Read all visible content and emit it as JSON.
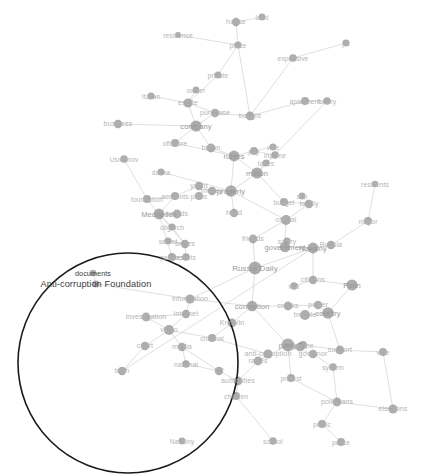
{
  "figure": {
    "type": "network-graph",
    "title": "",
    "width": 428,
    "height": 475,
    "background_color": "#ffffff",
    "node_color": "#8d8d8d",
    "edge_color": "#c9c9c9",
    "label_color": "#b4b4b4",
    "highlight_color": "#1a1a1a"
  },
  "highlight": {
    "shape": "circle",
    "label": "highlighted-cluster",
    "cx": 128,
    "cy": 363,
    "r": 110
  },
  "chart_data": {
    "type": "scatter",
    "title": "",
    "xlabel": "",
    "ylabel": "",
    "grid": false,
    "legend": "none",
    "nodes": [
      {
        "label": "residence",
        "x": 178,
        "y": 35,
        "size": 3.0,
        "weight": 1
      },
      {
        "label": "house",
        "x": 236,
        "y": 22,
        "size": 4.2,
        "weight": 2
      },
      {
        "label": "land",
        "x": 262,
        "y": 17,
        "size": 3.4,
        "weight": 1
      },
      {
        "label": "place",
        "x": 238,
        "y": 45,
        "size": 3.6,
        "weight": 1
      },
      {
        "label": "private",
        "x": 218,
        "y": 75,
        "size": 3.6,
        "weight": 1
      },
      {
        "label": "owner",
        "x": 196,
        "y": 90,
        "size": 3.4,
        "weight": 1
      },
      {
        "label": "estate",
        "x": 188,
        "y": 103,
        "size": 4.6,
        "weight": 2
      },
      {
        "label": "Italian",
        "x": 151,
        "y": 96,
        "size": 3.6,
        "weight": 1
      },
      {
        "label": "purchase",
        "x": 215,
        "y": 113,
        "size": 4.2,
        "weight": 2
      },
      {
        "label": "bought",
        "x": 250,
        "y": 116,
        "size": 4.4,
        "weight": 2
      },
      {
        "label": "expensive",
        "x": 293,
        "y": 58,
        "size": 3.8,
        "weight": 1
      },
      {
        "label": "jet",
        "x": 346,
        "y": 43,
        "size": 3.4,
        "weight": 1
      },
      {
        "label": "apartment",
        "x": 305,
        "y": 101,
        "size": 4.0,
        "weight": 1
      },
      {
        "label": "luxury",
        "x": 327,
        "y": 101,
        "size": 3.8,
        "weight": 1
      },
      {
        "label": "business",
        "x": 118,
        "y": 124,
        "size": 4.2,
        "weight": 2
      },
      {
        "label": "company",
        "x": 196,
        "y": 126,
        "size": 5.6,
        "weight": 3
      },
      {
        "label": "offshore",
        "x": 175,
        "y": 143,
        "size": 4.0,
        "weight": 1
      },
      {
        "label": "billion",
        "x": 211,
        "y": 148,
        "size": 4.4,
        "weight": 2
      },
      {
        "label": "rubles",
        "x": 234,
        "y": 156,
        "size": 5.4,
        "weight": 3
      },
      {
        "label": "pay",
        "x": 254,
        "y": 151,
        "size": 4.0,
        "weight": 1
      },
      {
        "label": "wife",
        "x": 273,
        "y": 147,
        "size": 3.4,
        "weight": 1
      },
      {
        "label": "income",
        "x": 275,
        "y": 155,
        "size": 3.8,
        "weight": 1
      },
      {
        "label": "taxes",
        "x": 266,
        "y": 163,
        "size": 3.6,
        "weight": 1
      },
      {
        "label": "Usmanov",
        "x": 124,
        "y": 159,
        "size": 3.8,
        "weight": 1
      },
      {
        "label": "dacha",
        "x": 161,
        "y": 172,
        "size": 3.6,
        "weight": 1
      },
      {
        "label": "million",
        "x": 257,
        "y": 173,
        "size": 5.6,
        "weight": 3
      },
      {
        "label": "money",
        "x": 212,
        "y": 191,
        "size": 4.2,
        "weight": 2
      },
      {
        "label": "property",
        "x": 231,
        "y": 191,
        "size": 5.8,
        "weight": 3
      },
      {
        "label": "yacht",
        "x": 199,
        "y": 186,
        "size": 4.2,
        "weight": 2
      },
      {
        "label": "plans",
        "x": 199,
        "y": 196,
        "size": 4.0,
        "weight": 1
      },
      {
        "label": "foundation",
        "x": 147,
        "y": 199,
        "size": 4.0,
        "weight": 1
      },
      {
        "label": "accounts",
        "x": 175,
        "y": 196,
        "size": 4.0,
        "weight": 1
      },
      {
        "label": "head",
        "x": 234,
        "y": 213,
        "size": 4.2,
        "weight": 2
      },
      {
        "label": "budget",
        "x": 284,
        "y": 202,
        "size": 4.0,
        "weight": 1
      },
      {
        "label": "son",
        "x": 302,
        "y": 196,
        "size": 3.4,
        "weight": 1
      },
      {
        "label": "family",
        "x": 309,
        "y": 204,
        "size": 4.2,
        "weight": 2
      },
      {
        "label": "residents",
        "x": 375,
        "y": 184,
        "size": 3.2,
        "weight": 1
      },
      {
        "label": "Medvedev",
        "x": 159,
        "y": 214,
        "size": 5.4,
        "weight": 3
      },
      {
        "label": "boards",
        "x": 177,
        "y": 214,
        "size": 4.4,
        "weight": 2
      },
      {
        "label": "oligarch",
        "x": 172,
        "y": 227,
        "size": 3.6,
        "weight": 1
      },
      {
        "label": "official",
        "x": 286,
        "y": 220,
        "size": 5.0,
        "weight": 2
      },
      {
        "label": "mayor",
        "x": 368,
        "y": 221,
        "size": 4.0,
        "weight": 1
      },
      {
        "label": "secret",
        "x": 168,
        "y": 241,
        "size": 3.6,
        "weight": 1
      },
      {
        "label": "bribes",
        "x": 185,
        "y": 244,
        "size": 4.2,
        "weight": 2
      },
      {
        "label": "friends",
        "x": 253,
        "y": 239,
        "size": 4.4,
        "weight": 2
      },
      {
        "label": "salary",
        "x": 287,
        "y": 241,
        "size": 3.6,
        "weight": 1
      },
      {
        "label": "government",
        "x": 285,
        "y": 247,
        "size": 5.2,
        "weight": 3
      },
      {
        "label": "Navalny",
        "x": 313,
        "y": 248,
        "size": 5.4,
        "weight": 3
      },
      {
        "label": "Russia",
        "x": 331,
        "y": 245,
        "size": 4.2,
        "weight": 2
      },
      {
        "label": "palaces",
        "x": 172,
        "y": 257,
        "size": 4.0,
        "weight": 1
      },
      {
        "label": "assets",
        "x": 186,
        "y": 257,
        "size": 3.8,
        "weight": 1
      },
      {
        "label": "Russia Daily",
        "x": 255,
        "y": 268,
        "size": 6.4,
        "weight": 4
      },
      {
        "label": "citizens",
        "x": 313,
        "y": 280,
        "size": 4.2,
        "weight": 2
      },
      {
        "label": "rich",
        "x": 294,
        "y": 286,
        "size": 3.8,
        "weight": 1
      },
      {
        "label": "Putin",
        "x": 352,
        "y": 285,
        "size": 5.6,
        "weight": 3
      },
      {
        "label": "documents",
        "x": 93,
        "y": 273,
        "size": 3.2,
        "weight": 1
      },
      {
        "label": "Anti-corruption Foundation",
        "x": 96,
        "y": 284,
        "size": 3.4,
        "weight": 1
      },
      {
        "label": "information",
        "x": 190,
        "y": 299,
        "size": 4.6,
        "weight": 2
      },
      {
        "label": "corruption",
        "x": 252,
        "y": 306,
        "size": 5.2,
        "weight": 3
      },
      {
        "label": "crooks",
        "x": 288,
        "y": 306,
        "size": 4.4,
        "weight": 2
      },
      {
        "label": "power",
        "x": 318,
        "y": 305,
        "size": 4.2,
        "weight": 2
      },
      {
        "label": "country",
        "x": 328,
        "y": 313,
        "size": 5.8,
        "weight": 3
      },
      {
        "label": "trouble",
        "x": 305,
        "y": 315,
        "size": 5.0,
        "weight": 2
      },
      {
        "label": "Kremlin",
        "x": 232,
        "y": 323,
        "size": 4.4,
        "weight": 2
      },
      {
        "label": "investigation",
        "x": 146,
        "y": 317,
        "size": 4.4,
        "weight": 2
      },
      {
        "label": "internet",
        "x": 186,
        "y": 314,
        "size": 4.2,
        "weight": 2
      },
      {
        "label": "video",
        "x": 169,
        "y": 330,
        "size": 5.0,
        "weight": 2
      },
      {
        "label": "criminal",
        "x": 212,
        "y": 338,
        "size": 4.0,
        "weight": 1
      },
      {
        "label": "media",
        "x": 182,
        "y": 347,
        "size": 4.2,
        "weight": 2
      },
      {
        "label": "court",
        "x": 145,
        "y": 346,
        "size": 4.2,
        "weight": 2
      },
      {
        "label": "anti-corruption",
        "x": 268,
        "y": 354,
        "size": 4.6,
        "weight": 2
      },
      {
        "label": "rallies",
        "x": 258,
        "y": 361,
        "size": 4.4,
        "weight": 2
      },
      {
        "label": "party",
        "x": 288,
        "y": 345,
        "size": 6.4,
        "weight": 4
      },
      {
        "label": "right",
        "x": 300,
        "y": 347,
        "size": 4.4,
        "weight": 2
      },
      {
        "label": "regime",
        "x": 303,
        "y": 345,
        "size": 4.0,
        "weight": 1
      },
      {
        "label": "governor",
        "x": 313,
        "y": 354,
        "size": 4.2,
        "weight": 2
      },
      {
        "label": "support",
        "x": 340,
        "y": 350,
        "size": 4.4,
        "weight": 2
      },
      {
        "label": "system",
        "x": 333,
        "y": 367,
        "size": 3.8,
        "weight": 1
      },
      {
        "label": "vote",
        "x": 383,
        "y": 352,
        "size": 4.0,
        "weight": 1
      },
      {
        "label": "truth",
        "x": 122,
        "y": 371,
        "size": 4.2,
        "weight": 2
      },
      {
        "label": "national",
        "x": 186,
        "y": 364,
        "size": 3.8,
        "weight": 1
      },
      {
        "label": "TV",
        "x": 219,
        "y": 371,
        "size": 4.2,
        "weight": 2
      },
      {
        "label": "authorities",
        "x": 238,
        "y": 381,
        "size": 4.4,
        "weight": 2
      },
      {
        "label": "protest",
        "x": 291,
        "y": 378,
        "size": 4.0,
        "weight": 1
      },
      {
        "label": "children",
        "x": 236,
        "y": 396,
        "size": 4.0,
        "weight": 1
      },
      {
        "label": "politicians",
        "x": 337,
        "y": 402,
        "size": 4.4,
        "weight": 2
      },
      {
        "label": "elections",
        "x": 393,
        "y": 409,
        "size": 4.6,
        "weight": 2
      },
      {
        "label": "public",
        "x": 322,
        "y": 424,
        "size": 4.0,
        "weight": 1
      },
      {
        "label": "Navalny",
        "x": 182,
        "y": 441,
        "size": 3.4,
        "weight": 1
      },
      {
        "label": "school",
        "x": 273,
        "y": 441,
        "size": 3.8,
        "weight": 1
      },
      {
        "label": "police",
        "x": 341,
        "y": 442,
        "size": 4.0,
        "weight": 1
      }
    ],
    "edges": [
      [
        "residence",
        "place"
      ],
      [
        "house",
        "place"
      ],
      [
        "house",
        "land"
      ],
      [
        "place",
        "private"
      ],
      [
        "place",
        "bought"
      ],
      [
        "private",
        "estate"
      ],
      [
        "owner",
        "estate"
      ],
      [
        "Italian",
        "estate"
      ],
      [
        "estate",
        "purchase"
      ],
      [
        "estate",
        "company"
      ],
      [
        "purchase",
        "company"
      ],
      [
        "purchase",
        "bought"
      ],
      [
        "bought",
        "apartment"
      ],
      [
        "bought",
        "expensive"
      ],
      [
        "expensive",
        "jet"
      ],
      [
        "apartment",
        "luxury"
      ],
      [
        "luxury",
        "million"
      ],
      [
        "business",
        "company"
      ],
      [
        "company",
        "offshore"
      ],
      [
        "company",
        "billion"
      ],
      [
        "offshore",
        "rubles"
      ],
      [
        "billion",
        "rubles"
      ],
      [
        "rubles",
        "pay"
      ],
      [
        "rubles",
        "million"
      ],
      [
        "pay",
        "income"
      ],
      [
        "pay",
        "wife"
      ],
      [
        "income",
        "taxes"
      ],
      [
        "taxes",
        "million"
      ],
      [
        "Usmanov",
        "foundation"
      ],
      [
        "dacha",
        "property"
      ],
      [
        "rubles",
        "property"
      ],
      [
        "million",
        "property"
      ],
      [
        "million",
        "budget"
      ],
      [
        "property",
        "money"
      ],
      [
        "property",
        "head"
      ],
      [
        "property",
        "official"
      ],
      [
        "money",
        "yacht"
      ],
      [
        "yacht",
        "accounts"
      ],
      [
        "accounts",
        "foundation"
      ],
      [
        "accounts",
        "Medvedev"
      ],
      [
        "foundation",
        "Medvedev"
      ],
      [
        "Medvedev",
        "boards"
      ],
      [
        "Medvedev",
        "oligarch"
      ],
      [
        "Medvedev",
        "bribes"
      ],
      [
        "Medvedev",
        "palaces"
      ],
      [
        "oligarch",
        "bribes"
      ],
      [
        "secret",
        "bribes"
      ],
      [
        "bribes",
        "assets"
      ],
      [
        "palaces",
        "assets"
      ],
      [
        "budget",
        "family"
      ],
      [
        "family",
        "son"
      ],
      [
        "family",
        "official"
      ],
      [
        "official",
        "friends"
      ],
      [
        "official",
        "government"
      ],
      [
        "friends",
        "Russia Daily"
      ],
      [
        "salary",
        "government"
      ],
      [
        "government",
        "Navalny"
      ],
      [
        "Navalny",
        "Russia"
      ],
      [
        "Russia",
        "mayor"
      ],
      [
        "mayor",
        "residents"
      ],
      [
        "Navalny",
        "Russia Daily"
      ],
      [
        "Russia Daily",
        "corruption"
      ],
      [
        "Russia Daily",
        "information"
      ],
      [
        "Navalny",
        "citizens"
      ],
      [
        "citizens",
        "rich"
      ],
      [
        "citizens",
        "Putin"
      ],
      [
        "Putin",
        "country"
      ],
      [
        "documents",
        "Anti-corruption Foundation"
      ],
      [
        "Anti-corruption Foundation",
        "information"
      ],
      [
        "information",
        "internet"
      ],
      [
        "information",
        "corruption"
      ],
      [
        "investigation",
        "internet"
      ],
      [
        "investigation",
        "video"
      ],
      [
        "internet",
        "video"
      ],
      [
        "video",
        "media"
      ],
      [
        "video",
        "court"
      ],
      [
        "video",
        "criminal"
      ],
      [
        "court",
        "truth"
      ],
      [
        "media",
        "national"
      ],
      [
        "media",
        "TV"
      ],
      [
        "national",
        "TV"
      ],
      [
        "corruption",
        "crooks"
      ],
      [
        "corruption",
        "Kremlin"
      ],
      [
        "corruption",
        "party"
      ],
      [
        "crooks",
        "power"
      ],
      [
        "power",
        "country"
      ],
      [
        "country",
        "trouble"
      ],
      [
        "country",
        "support"
      ],
      [
        "Kremlin",
        "criminal"
      ],
      [
        "criminal",
        "anti-corruption"
      ],
      [
        "anti-corruption",
        "rallies"
      ],
      [
        "rallies",
        "party"
      ],
      [
        "party",
        "right"
      ],
      [
        "party",
        "regime"
      ],
      [
        "party",
        "governor"
      ],
      [
        "party",
        "protest"
      ],
      [
        "regime",
        "support"
      ],
      [
        "support",
        "vote"
      ],
      [
        "governor",
        "system"
      ],
      [
        "system",
        "politicians"
      ],
      [
        "TV",
        "authorities"
      ],
      [
        "authorities",
        "children"
      ],
      [
        "authorities",
        "rallies"
      ],
      [
        "children",
        "school"
      ],
      [
        "truth",
        "Navalny"
      ],
      [
        "politicians",
        "elections"
      ],
      [
        "politicians",
        "public"
      ],
      [
        "public",
        "police"
      ],
      [
        "protest",
        "politicians"
      ],
      [
        "vote",
        "elections"
      ]
    ]
  }
}
